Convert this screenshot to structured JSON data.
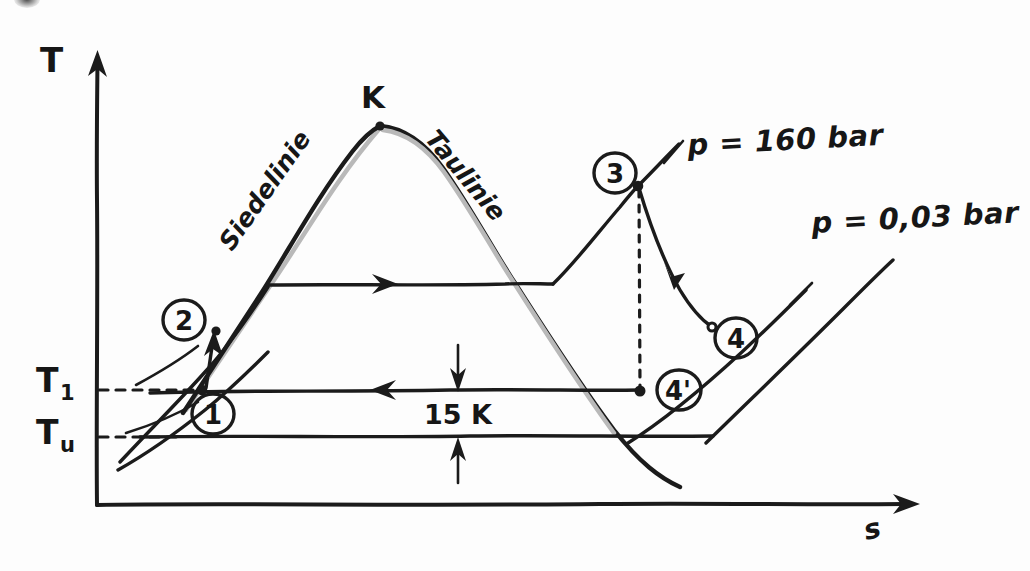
{
  "figure": {
    "kind": "hand-drawn T-s diagram of a steam power cycle",
    "axes": {
      "y_label": "T",
      "x_label": "s",
      "y_tick_labels": [
        {
          "base": "T",
          "sub": "1",
          "value_y": 390
        },
        {
          "base": "T",
          "sub": "u",
          "value_y": 437
        }
      ]
    },
    "curve_labels": {
      "boiling_line": "Siedelinie",
      "dew_line": "Taulinie",
      "critical_point": "K"
    },
    "isobars": [
      {
        "id": "high",
        "label": "p = 160 bar"
      },
      {
        "id": "low",
        "label": "p = 0,03 bar"
      }
    ],
    "state_points": [
      {
        "id": "1",
        "label": "1",
        "x": 202,
        "y": 390
      },
      {
        "id": "2",
        "label": "2",
        "x": 216,
        "y": 331
      },
      {
        "id": "3",
        "label": "3",
        "x": 638,
        "y": 186
      },
      {
        "id": "4",
        "label": "4",
        "x": 712,
        "y": 327
      },
      {
        "id": "4s",
        "label": "4'",
        "x": 640,
        "y": 391
      }
    ],
    "annotations": [
      {
        "id": "delta-t",
        "label": "15 K"
      }
    ],
    "colors": {
      "ink": "#1b1b1b",
      "paper": "#fdfdfd",
      "pencil_shadow": "#b9b9b9"
    }
  }
}
